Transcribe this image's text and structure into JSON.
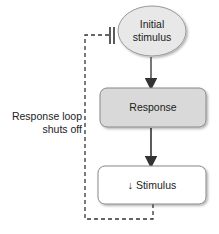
{
  "diagram": {
    "nodes": {
      "initial_stimulus": {
        "line1": "Initial",
        "line2": "stimulus",
        "shape": "ellipse",
        "fill": "#e6e6e6"
      },
      "response": {
        "label": "Response",
        "shape": "rounded-rect",
        "fill": "#d9d9d9"
      },
      "stimulus": {
        "arrow": "↓",
        "label": "Stimulus",
        "shape": "rounded-rect",
        "fill": "#ffffff"
      }
    },
    "feedback_label": {
      "line1": "Response loop",
      "line2": "shuts off"
    },
    "colors": {
      "arrow": "#333333",
      "dashed": "#333333",
      "border": "#8a8a8a"
    }
  }
}
